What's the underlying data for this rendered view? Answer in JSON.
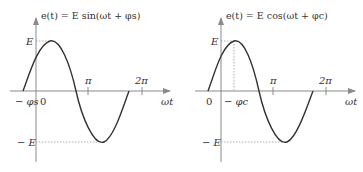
{
  "figure": {
    "panels": [
      {
        "id": "sine",
        "title": "e(t) = E sin(ωt + φs)",
        "x_axis_label": "ωt",
        "y_labels": {
          "pos": "E",
          "neg": "− E"
        },
        "x_ticks": {
          "origin": "0",
          "pi": "π",
          "two_pi": "2π",
          "phase": "− φs"
        },
        "function": "sin",
        "phase_symbol": "φs"
      },
      {
        "id": "cosine",
        "title": "e(t) = E cos(ωt + φc)",
        "x_axis_label": "ωt",
        "y_labels": {
          "pos": "E",
          "neg": "− E"
        },
        "x_ticks": {
          "origin": "0",
          "pi": "π",
          "two_pi": "2π",
          "phase": "− φc"
        },
        "function": "cos",
        "phase_symbol": "φc"
      }
    ],
    "colors": {
      "axis": "#8a8a8a",
      "curve": "#333333",
      "dashed": "#9a9a9a",
      "text": "#333333"
    }
  }
}
